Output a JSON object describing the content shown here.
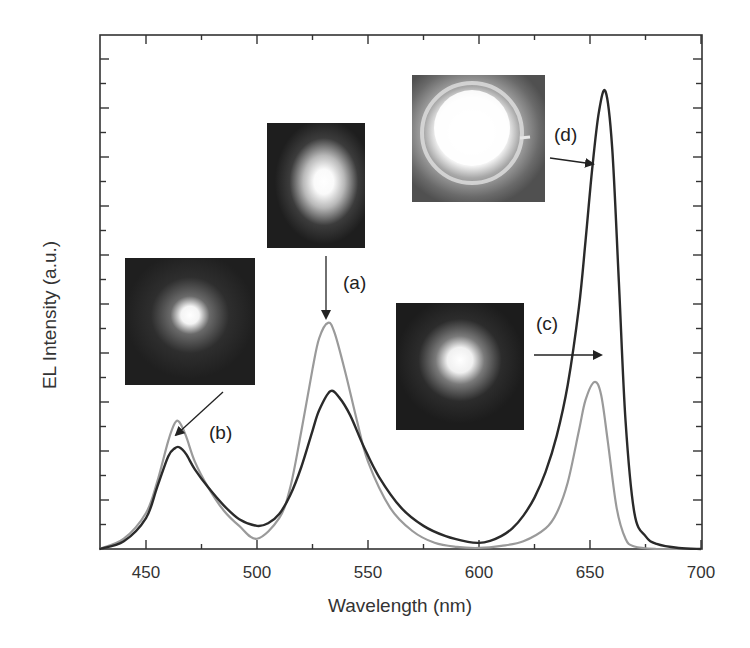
{
  "chart_data": {
    "type": "line",
    "title": "",
    "xlabel": "Wavelength (nm)",
    "ylabel": "EL Intensity (a.u.)",
    "xlim": [
      429,
      700
    ],
    "ylim": [
      0,
      1
    ],
    "x_ticks": [
      450,
      500,
      550,
      600,
      650,
      700
    ],
    "x_tick_labels": [
      "450",
      "500",
      "550",
      "600",
      "650",
      "700"
    ],
    "y_tick_labels": [],
    "grid": false,
    "legend": null,
    "series": [
      {
        "name": "gray spectrum (a, b, c)",
        "color": "#9a9a9a",
        "x": [
          429,
          440,
          450,
          455,
          460,
          463,
          465,
          468,
          472,
          478,
          485,
          492,
          500,
          510,
          515,
          520,
          525,
          528,
          532,
          535,
          540,
          545,
          550,
          560,
          570,
          580,
          590,
          600,
          610,
          620,
          630,
          635,
          640,
          645,
          648,
          652,
          655,
          658,
          662,
          666,
          670,
          680,
          690,
          700
        ],
        "y": [
          0.0,
          0.02,
          0.07,
          0.13,
          0.21,
          0.245,
          0.247,
          0.22,
          0.17,
          0.12,
          0.075,
          0.045,
          0.02,
          0.06,
          0.12,
          0.23,
          0.35,
          0.41,
          0.44,
          0.42,
          0.34,
          0.25,
          0.17,
          0.08,
          0.035,
          0.012,
          0.004,
          0.002,
          0.006,
          0.015,
          0.04,
          0.07,
          0.13,
          0.23,
          0.29,
          0.325,
          0.3,
          0.21,
          0.08,
          0.02,
          0.005,
          0.0,
          0.0,
          0.0
        ]
      },
      {
        "name": "dark spectrum (d)",
        "color": "#2a2a2a",
        "x": [
          429,
          440,
          450,
          455,
          460,
          463,
          465,
          468,
          472,
          478,
          485,
          492,
          500,
          505,
          510,
          515,
          520,
          525,
          528,
          533,
          537,
          542,
          548,
          555,
          565,
          575,
          585,
          595,
          600,
          605,
          610,
          615,
          620,
          625,
          630,
          635,
          640,
          645,
          648,
          651,
          654,
          657,
          660,
          663,
          666,
          670,
          675,
          680,
          690,
          700
        ],
        "y": [
          0.0,
          0.015,
          0.06,
          0.12,
          0.18,
          0.196,
          0.198,
          0.185,
          0.155,
          0.12,
          0.085,
          0.058,
          0.045,
          0.05,
          0.068,
          0.105,
          0.16,
          0.23,
          0.27,
          0.307,
          0.295,
          0.26,
          0.2,
          0.14,
          0.08,
          0.045,
          0.025,
          0.014,
          0.012,
          0.016,
          0.025,
          0.04,
          0.065,
          0.1,
          0.15,
          0.22,
          0.32,
          0.47,
          0.6,
          0.74,
          0.85,
          0.89,
          0.78,
          0.52,
          0.25,
          0.07,
          0.025,
          0.01,
          0.002,
          0.0
        ]
      }
    ],
    "annotations": [
      {
        "label": "(a)",
        "target": "green peak ~532 nm",
        "arrow": "down"
      },
      {
        "label": "(b)",
        "target": "blue peak ~465 nm",
        "arrow": "down-left"
      },
      {
        "label": "(c)",
        "target": "red peak ~652 nm (gray curve)",
        "arrow": "right"
      },
      {
        "label": "(d)",
        "target": "red peak ~657 nm (dark curve)",
        "arrow": "right"
      }
    ],
    "insets": [
      {
        "id": "a",
        "description": "emission photo, bright spot with scattered glow"
      },
      {
        "id": "b",
        "description": "emission photo, small bright spot"
      },
      {
        "id": "c",
        "description": "emission photo, bright irregular spot"
      },
      {
        "id": "d",
        "description": "emission photo, bright ring-shaped device"
      }
    ]
  },
  "axes": {
    "xlabel": "Wavelength (nm)",
    "ylabel": "EL Intensity (a.u.)",
    "x_tick_labels": [
      "450",
      "500",
      "550",
      "600",
      "650",
      "700"
    ]
  },
  "labels": {
    "a": "(a)",
    "b": "(b)",
    "c": "(c)",
    "d": "(d)"
  }
}
